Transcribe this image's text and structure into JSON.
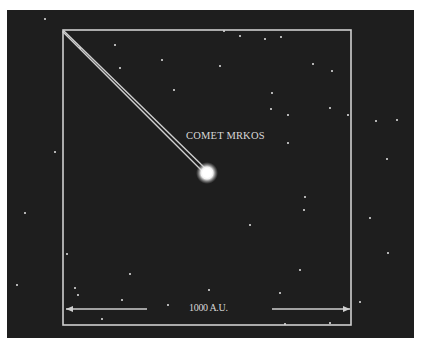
{
  "figure": {
    "background_color": "#ffffff",
    "sky_color": "#1e1e1e",
    "line_color": "#cfcfcf",
    "sky_rect": {
      "x": 7,
      "y": 10,
      "w": 407,
      "h": 328
    },
    "frame_rect": {
      "x": 63,
      "y": 30,
      "w": 288,
      "h": 295
    }
  },
  "comet": {
    "label": "COMET MRKOS",
    "head": {
      "cx": 207,
      "cy": 173,
      "r": 7
    },
    "tail_start": {
      "x": 63,
      "y": 31
    },
    "tail_separation": 4
  },
  "scale_bar": {
    "label": "1000 A.U.",
    "y": 309,
    "left_arrow": {
      "x1": 147,
      "x2": 66
    },
    "right_arrow": {
      "x1": 272,
      "x2": 350
    }
  },
  "stars": [
    [
      45,
      19
    ],
    [
      115,
      45
    ],
    [
      162,
      60
    ],
    [
      224,
      31
    ],
    [
      240,
      36
    ],
    [
      174,
      90
    ],
    [
      120,
      68
    ],
    [
      220,
      66
    ],
    [
      265,
      39
    ],
    [
      281,
      37
    ],
    [
      313,
      64
    ],
    [
      332,
      71
    ],
    [
      272,
      93
    ],
    [
      271,
      109
    ],
    [
      330,
      108
    ],
    [
      288,
      143
    ],
    [
      288,
      115
    ],
    [
      305,
      197
    ],
    [
      304,
      210
    ],
    [
      250,
      225
    ],
    [
      300,
      270
    ],
    [
      370,
      218
    ],
    [
      348,
      115
    ],
    [
      376,
      121
    ],
    [
      387,
      159
    ],
    [
      388,
      253
    ],
    [
      55,
      152
    ],
    [
      25,
      213
    ],
    [
      17,
      285
    ],
    [
      67,
      254
    ],
    [
      130,
      274
    ],
    [
      75,
      288
    ],
    [
      78,
      295
    ],
    [
      209,
      290
    ],
    [
      280,
      293
    ],
    [
      330,
      323
    ],
    [
      285,
      324
    ],
    [
      360,
      302
    ],
    [
      102,
      319
    ],
    [
      168,
      305
    ],
    [
      122,
      300
    ],
    [
      397,
      120
    ],
    [
      80,
      48
    ]
  ]
}
